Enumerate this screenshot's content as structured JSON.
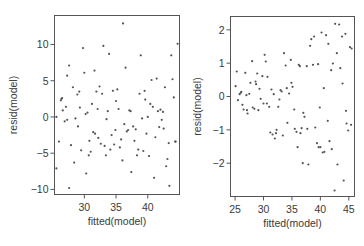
{
  "chart_data": [
    {
      "type": "scatter",
      "title": "",
      "xlabel": "fitted(model)",
      "ylabel": "resid(model)",
      "xlim": [
        25.3,
        45.0
      ],
      "ylim": [
        -10.7,
        14.0
      ],
      "xticks": [
        30,
        35,
        40
      ],
      "yticks": [
        -10,
        -5,
        0,
        5,
        10
      ],
      "grid": false,
      "legend": null,
      "frame": {
        "left": 54.5,
        "right": 179.5,
        "top": 15.5,
        "bottom": 194.5
      },
      "x": [
        25.6,
        25.6,
        26.0,
        26.3,
        26.4,
        26.5,
        26.6,
        26.9,
        27.1,
        27.3,
        27.3,
        27.6,
        27.6,
        27.9,
        28.2,
        28.4,
        28.6,
        28.9,
        29.0,
        29.2,
        29.3,
        29.5,
        29.8,
        30.0,
        30.2,
        30.3,
        30.5,
        30.7,
        30.8,
        31.0,
        31.2,
        31.4,
        31.6,
        31.7,
        31.9,
        32.1,
        32.2,
        32.4,
        32.6,
        32.8,
        33.0,
        33.2,
        33.4,
        33.5,
        33.7,
        33.9,
        34.1,
        34.3,
        34.5,
        34.7,
        34.9,
        35.0,
        35.2,
        35.4,
        35.6,
        35.8,
        36.0,
        36.1,
        36.3,
        36.5,
        36.7,
        36.9,
        37.1,
        37.3,
        37.4,
        37.7,
        37.9,
        38.1,
        38.3,
        38.5,
        38.7,
        38.9,
        39.1,
        39.3,
        39.5,
        39.6,
        39.8,
        40.0,
        40.2,
        40.4,
        40.6,
        40.8,
        41.0,
        41.2,
        41.4,
        41.6,
        41.8,
        42.0,
        42.2,
        42.4,
        42.5,
        42.7,
        42.9,
        43.1,
        43.3,
        43.4,
        43.7,
        43.9,
        44.1,
        44.3,
        44.4,
        44.7
      ],
      "y": [
        0.0,
        -7.1,
        -3.4,
        2.3,
        2.5,
        2.6,
        0.9,
        -0.6,
        1.4,
        -0.4,
        5.7,
        7.1,
        -9.8,
        -3.9,
        4.1,
        -6.3,
        -0.2,
        3.1,
        -1.3,
        3.5,
        1.3,
        -4.6,
        9.5,
        6.1,
        0.4,
        -7.8,
        0.6,
        -5.3,
        -3.3,
        -4.8,
        1.8,
        -2.1,
        6.4,
        -2.3,
        3.5,
        1.1,
        -2.9,
        4.2,
        -3.7,
        3.2,
        9.8,
        -4.0,
        -5.3,
        -0.3,
        0.8,
        8.7,
        -4.5,
        -2.5,
        3.6,
        -3.8,
        -1.8,
        2.2,
        3.8,
        1.1,
        -4.2,
        -3.1,
        -6.0,
        12.9,
        -1.0,
        6.8,
        -2.0,
        -1.8,
        0.9,
        0.8,
        -7.6,
        -1.3,
        -3.3,
        -1.7,
        -5.3,
        -4.5,
        3.2,
        8.5,
        -0.2,
        -4.7,
        3.6,
        2.4,
        -2.3,
        0.0,
        -5.4,
        1.8,
        5.1,
        1.4,
        -8.4,
        -2.8,
        5.3,
        0.8,
        -1.4,
        1.0,
        -0.4,
        0.7,
        -1.6,
        4.1,
        -6.8,
        -5.8,
        -3.6,
        -9.5,
        8.5,
        5.2,
        2.7,
        -3.4,
        -3.4,
        10.1
      ]
    },
    {
      "type": "scatter",
      "title": "",
      "xlabel": "fitted(model)",
      "ylabel": "resid(model)",
      "xlim": [
        24.2,
        46.0
      ],
      "ylim": [
        -3.0,
        2.4
      ],
      "xticks": [
        25,
        30,
        35,
        40,
        45
      ],
      "yticks": [
        -2,
        -1,
        0,
        1,
        2
      ],
      "grid": false,
      "legend": null,
      "frame": {
        "left": 230.5,
        "right": 354.5,
        "top": 16.5,
        "bottom": 196.5
      },
      "x": [
        25.1,
        25.3,
        25.5,
        25.8,
        26.0,
        26.1,
        26.3,
        26.5,
        26.8,
        27.0,
        27.1,
        27.2,
        27.5,
        27.7,
        28.0,
        28.1,
        28.4,
        28.6,
        28.7,
        28.9,
        29.1,
        29.3,
        29.5,
        29.8,
        30.0,
        30.2,
        30.4,
        30.6,
        30.7,
        31.0,
        31.2,
        31.4,
        31.6,
        31.8,
        32.0,
        32.2,
        32.3,
        32.6,
        32.8,
        33.0,
        33.2,
        33.4,
        33.6,
        33.9,
        34.1,
        34.2,
        34.5,
        34.8,
        34.9,
        35.1,
        35.4,
        35.5,
        35.8,
        36.0,
        36.2,
        36.4,
        36.5,
        36.7,
        36.9,
        37.0,
        37.2,
        37.6,
        37.7,
        37.9,
        38.2,
        38.4,
        38.7,
        38.9,
        39.1,
        39.4,
        39.6,
        39.7,
        39.9,
        40.0,
        40.2,
        40.4,
        40.6,
        40.7,
        41.0,
        41.3,
        41.4,
        41.6,
        41.9,
        42.0,
        42.2,
        42.5,
        42.6,
        42.9,
        43.0,
        43.3,
        43.5,
        43.8,
        43.9,
        44.1,
        44.4,
        44.5,
        44.6,
        44.9,
        45.2,
        45.4,
        45.5
      ],
      "y": [
        0.31,
        0.75,
        -0.11,
        0.07,
        0.11,
        0.14,
        -0.25,
        -0.39,
        0.71,
        0.04,
        -0.41,
        -0.51,
        0.08,
        0.41,
        1.06,
        -0.33,
        -0.37,
        0.45,
        0.37,
        0.69,
        -0.41,
        0.23,
        -0.07,
        0.61,
        -0.21,
        1.25,
        1.05,
        -0.21,
        0.59,
        -0.31,
        -1.08,
        0.21,
        -1.14,
        0.07,
        -1.26,
        -1.1,
        -1.0,
        -0.31,
        -0.09,
        0.19,
        0.15,
        -1.17,
        1.3,
        0.93,
        0.25,
        -0.79,
        0.09,
        1.1,
        0.41,
        0.29,
        -0.39,
        -0.97,
        -1.06,
        -1.52,
        0.95,
        0.91,
        -1.1,
        -0.95,
        -2.0,
        -0.49,
        -0.61,
        0.91,
        -0.97,
        -2.04,
        1.52,
        1.72,
        0.95,
        1.8,
        -0.93,
        -1.4,
        0.97,
        -1.52,
        -0.33,
        -1.52,
        1.92,
        -1.68,
        0.25,
        -1.66,
        1.84,
        -0.73,
        1.58,
        -1.34,
        0.79,
        -1.58,
        0.99,
        -2.82,
        2.18,
        1.3,
        -2.04,
        2.16,
        0.85,
        1.8,
        0.39,
        -2.52,
        1.88,
        -0.43,
        -0.81,
        -1.02,
        1.48,
        -0.85,
        1.44
      ]
    }
  ],
  "panels": [
    {
      "xlabel": "fitted(model)",
      "ylabel": "resid(model)",
      "xtick_labels": [
        "30",
        "35",
        "40"
      ],
      "ytick_labels": [
        "-10",
        "-5",
        "0",
        "5",
        "10"
      ]
    },
    {
      "xlabel": "fitted(model)",
      "ylabel": "resid(model)",
      "xtick_labels": [
        "25",
        "30",
        "35",
        "40",
        "45"
      ],
      "ytick_labels": [
        "-2",
        "-1",
        "0",
        "1",
        "2"
      ]
    }
  ]
}
